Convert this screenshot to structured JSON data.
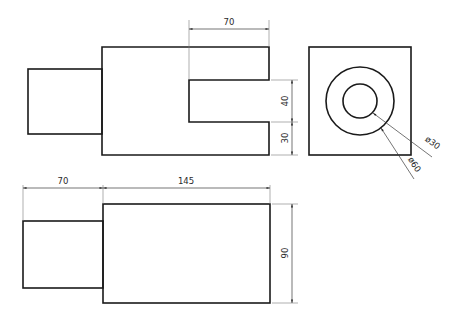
{
  "drawing": {
    "views": {
      "top": {
        "dimensions": {
          "slot_length": "70",
          "slot_width": "40",
          "bottom_wall": "30"
        }
      },
      "side": {
        "dimensions": {
          "inner_diameter": "ø30",
          "outer_diameter": "ø60"
        }
      },
      "front": {
        "dimensions": {
          "boss_length": "70",
          "body_length": "145",
          "height": "90"
        }
      }
    }
  }
}
